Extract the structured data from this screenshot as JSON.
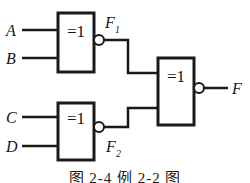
{
  "figure": {
    "type": "logic-circuit-schematic",
    "caption": "图 2-4  例 2-2 图",
    "line_color": "#1a1a1a",
    "background_color": "#ffffff"
  },
  "gates": [
    {
      "id": "gate-1",
      "symbol": "=1",
      "function": "XNOR",
      "inverted_output": true,
      "inputs": [
        "A",
        "B"
      ],
      "output": "F1",
      "output_label": "F",
      "output_subscript": "1"
    },
    {
      "id": "gate-2",
      "symbol": "=1",
      "function": "XNOR",
      "inverted_output": true,
      "inputs": [
        "C",
        "D"
      ],
      "output": "F2",
      "output_label": "F",
      "output_subscript": "2"
    },
    {
      "id": "gate-3",
      "symbol": "=1",
      "function": "XNOR",
      "inverted_output": true,
      "inputs": [
        "F1",
        "F2"
      ],
      "output": "F",
      "output_label": "F",
      "output_subscript": ""
    }
  ],
  "signals": {
    "input_a": "A",
    "input_b": "B",
    "input_c": "C",
    "input_d": "D",
    "inter_f1": "F",
    "inter_f1_sub": "1",
    "inter_f2": "F",
    "inter_f2_sub": "2",
    "output_f": "F"
  }
}
